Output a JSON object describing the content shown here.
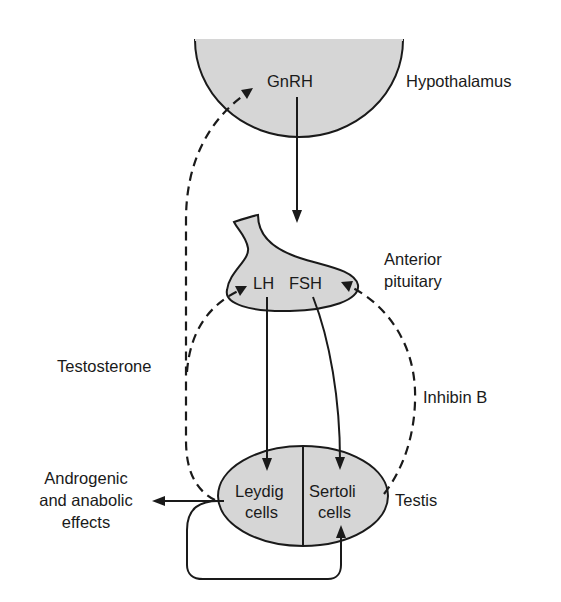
{
  "diagram": {
    "type": "hormonal-feedback-diagram",
    "organs": {
      "hypothalamus": {
        "label": "Hypothalamus",
        "hormone": "GnRH"
      },
      "pituitary": {
        "label_line1": "Anterior",
        "label_line2": "pituitary",
        "hormone_lh": "LH",
        "hormone_fsh": "FSH"
      },
      "testis": {
        "label": "Testis",
        "leydig_line1": "Leydig",
        "leydig_line2": "cells",
        "sertoli_line1": "Sertoli",
        "sertoli_line2": "cells"
      }
    },
    "feedback": {
      "testosterone": "Testosterone",
      "inhibin": "Inhibin B"
    },
    "effects": {
      "line1": "Androgenic",
      "line2": "and anabolic",
      "line3": "effects"
    },
    "colors": {
      "organ_fill": "#d6d6d6",
      "stroke": "#1a1a1a"
    }
  }
}
